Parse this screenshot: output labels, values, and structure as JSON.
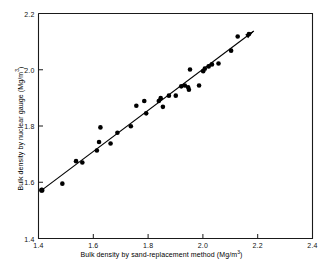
{
  "chart_data": {
    "type": "scatter",
    "title": "",
    "xlabel": "Bulk density by sand-replacement method (Mg/m3)",
    "ylabel": "Bulk density by nuclear gauge (Mg/m3)",
    "xlabel_main": "Bulk density by sand-replacement method (Mg/m",
    "xlabel_sup": "3",
    "xlabel_tail": ")",
    "ylabel_main": "Bulk density by nuclear gauge (Mg/m",
    "ylabel_sup": "3",
    "ylabel_tail": ")",
    "xlim": [
      1.4,
      2.4
    ],
    "ylim": [
      1.4,
      2.2
    ],
    "xticks": [
      1.4,
      1.6,
      1.8,
      2.0,
      2.2,
      2.4
    ],
    "xtick_labels": [
      "1.4",
      "1.6",
      "1.8",
      "2.0",
      "2.2",
      "2.4"
    ],
    "yticks": [
      1.4,
      1.6,
      1.8,
      2.0,
      2.2
    ],
    "ytick_labels": [
      "1.4",
      "1.6",
      "1.8",
      "2.0",
      "2.2"
    ],
    "grid": false,
    "legend": "none",
    "marker": "filled-circle",
    "marker_color": "#000000",
    "marker_size_px": 4.6,
    "axis_color": "#1a1a1a",
    "background": "#ffffff",
    "points": [
      [
        1.412,
        1.572
      ],
      [
        1.487,
        1.595
      ],
      [
        1.537,
        1.675
      ],
      [
        1.56,
        1.67
      ],
      [
        1.613,
        1.713
      ],
      [
        1.621,
        1.743
      ],
      [
        1.626,
        1.795
      ],
      [
        1.663,
        1.738
      ],
      [
        1.688,
        1.776
      ],
      [
        1.737,
        1.799
      ],
      [
        1.757,
        1.872
      ],
      [
        1.786,
        1.889
      ],
      [
        1.793,
        1.845
      ],
      [
        1.839,
        1.889
      ],
      [
        1.846,
        1.899
      ],
      [
        1.854,
        1.868
      ],
      [
        1.876,
        1.908
      ],
      [
        1.901,
        1.908
      ],
      [
        1.921,
        1.941
      ],
      [
        1.934,
        1.944
      ],
      [
        1.946,
        1.938
      ],
      [
        1.949,
        1.929
      ],
      [
        1.953,
        2.001
      ],
      [
        1.986,
        1.944
      ],
      [
        2.001,
        1.995
      ],
      [
        2.007,
        2.004
      ],
      [
        2.021,
        2.012
      ],
      [
        2.033,
        2.019
      ],
      [
        2.057,
        2.022
      ],
      [
        2.103,
        2.068
      ],
      [
        2.127,
        2.118
      ],
      [
        2.168,
        2.127
      ]
    ],
    "fit_line": {
      "type": "line",
      "x": [
        1.412,
        2.186
      ],
      "y": [
        1.572,
        2.138
      ],
      "has_arrow_end": true,
      "has_marker_start": true,
      "color": "#000000",
      "width_px": 1.1
    }
  }
}
